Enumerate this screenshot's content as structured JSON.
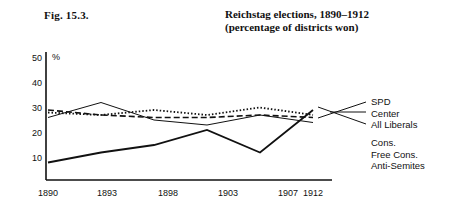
{
  "figure_label": "Fig. 15.3.",
  "title": {
    "line1": "Reichstag elections, 1890–1912",
    "line2": "(percentage of districts won)"
  },
  "axis": {
    "y_unit": "%",
    "y_ticks": [
      "50",
      "40",
      "30",
      "20",
      "10"
    ],
    "x_ticks": [
      "1890",
      "1893",
      "1898",
      "1903",
      "1907",
      "1912"
    ]
  },
  "legend": {
    "top_group": [
      "SPD",
      "Center",
      "All Liberals"
    ],
    "bottom_group": [
      "Cons.",
      "Free Cons.",
      "Anti-Semites"
    ]
  },
  "chart_data": {
    "type": "line",
    "title": "Reichstag elections, 1890–1912 (percentage of districts won)",
    "xlabel": "",
    "ylabel": "%",
    "x": [
      1890,
      1893,
      1898,
      1903,
      1907,
      1912
    ],
    "categories": [
      "1890",
      "1893",
      "1898",
      "1903",
      "1907",
      "1912"
    ],
    "ylim": [
      0,
      50
    ],
    "xlim": [
      1890,
      1912
    ],
    "grid": false,
    "legend_position": "right",
    "series": [
      {
        "name": "SPD",
        "style": "solid",
        "values": [
          7,
          11,
          14,
          20,
          11,
          28
        ]
      },
      {
        "name": "Center",
        "style": "dotted",
        "values": [
          27,
          26,
          28,
          26,
          29,
          26
        ]
      },
      {
        "name": "All Liberals",
        "style": "dashed",
        "values": [
          28,
          26,
          25,
          25,
          26,
          25
        ]
      },
      {
        "name": "Cons. / Free Cons. / Anti-Semites",
        "style": "thin-solid",
        "values": [
          25,
          31,
          24,
          22,
          26,
          23
        ]
      }
    ]
  }
}
